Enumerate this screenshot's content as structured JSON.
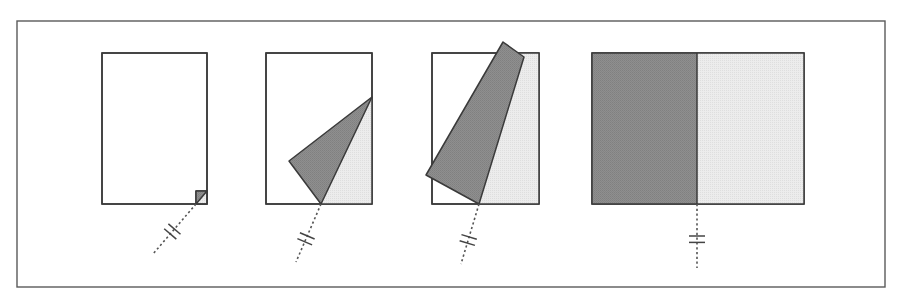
{
  "diagram": {
    "title": "",
    "colors": {
      "frame_stroke": "#5a5a5a",
      "outline": "#3a3a3a",
      "flap_dark": "#8c8c8c",
      "reveal_light": "#e8e8e8",
      "paper": "#ffffff",
      "dashed_axis": "#555555"
    },
    "frame": {
      "x": 17,
      "y": 21,
      "width": 868,
      "height": 266
    },
    "panels": [
      {
        "id": "step-1",
        "label": "Corner begins to fold",
        "sheet": {
          "x": 102,
          "y": 53,
          "width": 105,
          "height": 151
        },
        "revealed_region": [
          [
            196,
            191
          ],
          [
            207,
            191
          ],
          [
            207,
            204
          ],
          [
            196,
            204
          ]
        ],
        "folded_flap": [
          [
            196,
            191
          ],
          [
            207,
            191
          ],
          [
            196,
            204
          ]
        ],
        "hinge_point": [
          196,
          204
        ],
        "axis_line": {
          "from": [
            196,
            204
          ],
          "to": [
            153,
            254
          ]
        },
        "break_mark_at": 0.55
      },
      {
        "id": "step-2",
        "label": "Flap lifted further",
        "sheet": {
          "x": 266,
          "y": 53,
          "width": 106,
          "height": 151
        },
        "revealed_region": [
          [
            372,
            97
          ],
          [
            372,
            204
          ],
          [
            321,
            204
          ]
        ],
        "folded_flap": [
          [
            372,
            97
          ],
          [
            321,
            204
          ],
          [
            289,
            161
          ]
        ],
        "hinge_point": [
          321,
          204
        ],
        "axis_line": {
          "from": [
            321,
            204
          ],
          "to": [
            296,
            262
          ]
        },
        "break_mark_at": 0.6
      },
      {
        "id": "step-3",
        "label": "Flap rotating past vertical",
        "sheet": {
          "x": 432,
          "y": 53,
          "width": 107,
          "height": 151
        },
        "revealed_region": [
          [
            520,
            53
          ],
          [
            539,
            53
          ],
          [
            539,
            204
          ],
          [
            479,
            204
          ]
        ],
        "folded_flap": [
          [
            503,
            42
          ],
          [
            524,
            57
          ],
          [
            479,
            204
          ],
          [
            426,
            175
          ]
        ],
        "hinge_point": [
          479,
          204
        ],
        "axis_line": {
          "from": [
            479,
            204
          ],
          "to": [
            461,
            264
          ]
        },
        "break_mark_at": 0.6
      },
      {
        "id": "step-4",
        "label": "Sheet fully opened along fold",
        "sheet": {
          "x": 592,
          "y": 53,
          "width": 212,
          "height": 151
        },
        "left_half": {
          "x": 592,
          "y": 53,
          "width": 105,
          "height": 151
        },
        "right_half": {
          "x": 697,
          "y": 53,
          "width": 107,
          "height": 151
        },
        "fold_line_x": 697,
        "axis_line": {
          "from": [
            697,
            204
          ],
          "to": [
            697,
            268
          ]
        },
        "break_mark_at": 0.55
      }
    ]
  }
}
